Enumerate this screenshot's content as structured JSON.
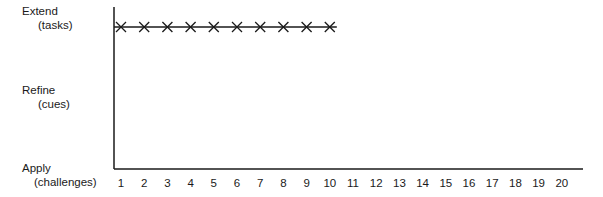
{
  "chart_data": {
    "type": "line",
    "title": "",
    "xlabel": "",
    "ylabel": "",
    "x_ticks": [
      1,
      2,
      3,
      4,
      5,
      6,
      7,
      8,
      9,
      10,
      11,
      12,
      13,
      14,
      15,
      16,
      17,
      18,
      19,
      20
    ],
    "xlim": [
      1,
      20
    ],
    "y_categories": [
      {
        "label": "Extend",
        "sub": "(tasks)"
      },
      {
        "label": "Refine",
        "sub": "(cues)"
      },
      {
        "label": "Apply",
        "sub": "(challenges)"
      }
    ],
    "series": [
      {
        "name": "sessions",
        "marker": "x",
        "x": [
          1,
          2,
          3,
          4,
          5,
          6,
          7,
          8,
          9,
          10
        ],
        "y": [
          "Extend",
          "Extend",
          "Extend",
          "Extend",
          "Extend",
          "Extend",
          "Extend",
          "Extend",
          "Extend",
          "Extend"
        ]
      }
    ],
    "grid": false,
    "legend": "none",
    "colors": {
      "line": "#1a1a1a",
      "marker": "#1a1a1a"
    }
  }
}
